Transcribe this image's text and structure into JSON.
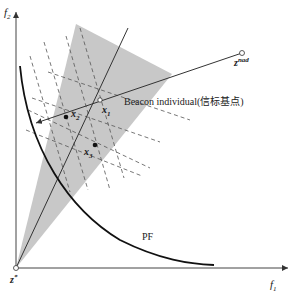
{
  "diagram": {
    "type": "objective-space-illustration",
    "axes": {
      "x_label": "f",
      "x_label_sub": "1",
      "y_label": "f",
      "y_label_sub": "2"
    },
    "points": {
      "ideal": {
        "label": "z",
        "sup": "*"
      },
      "nadir": {
        "label": "z",
        "sup": "nad"
      },
      "beacon": {
        "label": "x",
        "sub": "1"
      },
      "x2": {
        "label": "x",
        "sub": "2"
      },
      "x3": {
        "label": "x",
        "sub": "3"
      }
    },
    "annotations": {
      "beacon_text": "Beacon individual(信标基点)",
      "front_label": "PF"
    },
    "colors": {
      "shade": "#c8c8c8",
      "line": "#333333",
      "dashed": "#555555",
      "background": "#ffffff"
    }
  }
}
